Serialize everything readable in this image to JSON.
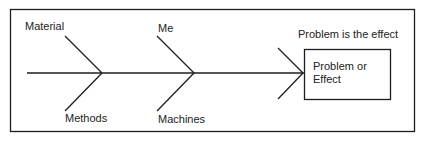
{
  "diagram": {
    "type": "fishbone",
    "colors": {
      "line": "#1e1e1e",
      "background": "#ffffff",
      "text": "#222222"
    },
    "causes": [
      {
        "label": "Material",
        "position": "top"
      },
      {
        "label": "Methods",
        "position": "bottom"
      },
      {
        "label": "Me",
        "position": "top"
      },
      {
        "label": "Machines",
        "position": "bottom"
      }
    ],
    "effect": {
      "caption": "Problem is the effect",
      "box_line1": "Problem or",
      "box_line2": "Effect"
    }
  }
}
